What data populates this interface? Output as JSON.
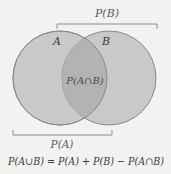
{
  "diagram": {
    "type": "venn",
    "sets": [
      {
        "name": "A",
        "label": "A",
        "cx": 60,
        "cy": 78,
        "r": 47
      },
      {
        "name": "B",
        "label": "B",
        "cx": 109,
        "cy": 78,
        "r": 47
      }
    ],
    "intersection_label": "P(A∩B)",
    "brackets": {
      "top_label": "P(B)",
      "bottom_label": "P(A)"
    },
    "formula": "P(A∪B) = P(A) + P(B) − P(A∩B)",
    "colors": {
      "background": "#f2f2f0",
      "circle_fill": "#c9c9c7",
      "overlap_fill": "#b3b3b1",
      "circle_stroke": "#8a8a88",
      "bracket": "#8c8c8c",
      "label_text": "#4a4a4a",
      "formula_text": "#3a3a3a"
    }
  }
}
